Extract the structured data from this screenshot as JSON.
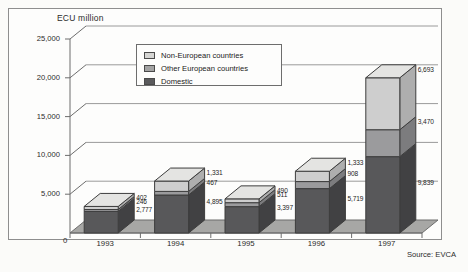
{
  "figure": {
    "source_note": "Source: EVCA"
  },
  "legend": {
    "items": [
      {
        "label": "Non-European countries",
        "key": "non_european",
        "color": "#d5d5d3"
      },
      {
        "label": "Other European countries",
        "key": "other_european",
        "color": "#a3a3a3"
      },
      {
        "label": "Domestic",
        "key": "domestic",
        "color": "#5a5a5c"
      }
    ]
  },
  "chart_data": {
    "type": "bar",
    "subtype": "stacked-column-3d",
    "title": "ECU million",
    "xlabel": "",
    "ylabel": "ECU million",
    "categories": [
      "1993",
      "1994",
      "1995",
      "1996",
      "1997"
    ],
    "ylim": [
      0,
      25000
    ],
    "ytick_labels": [
      "25,000",
      "20,000",
      "15,000",
      "10,000",
      "5,000"
    ],
    "ytick_values": [
      25000,
      20000,
      15000,
      10000,
      5000
    ],
    "origin_label": "0",
    "grid": true,
    "legend_position": "upper-left-inside",
    "series": [
      {
        "name": "Domestic",
        "color": "#58585a",
        "values": [
          2777,
          4895,
          3397,
          5719,
          9839
        ],
        "labels": [
          "2,777",
          "4,895",
          "3,397",
          "5,719",
          "9,839"
        ]
      },
      {
        "name": "Other European countries",
        "color": "#9b9b9d",
        "values": [
          246,
          467,
          511,
          908,
          3470
        ],
        "labels": [
          "246",
          "467",
          "511",
          "908",
          "3,470"
        ]
      },
      {
        "name": "Non-European countries",
        "color": "#cecece",
        "values": [
          402,
          1331,
          490,
          1333,
          6693
        ],
        "labels": [
          "402",
          "1,331",
          "490",
          "1,333",
          "6,693"
        ]
      }
    ],
    "totals": [
      3425,
      6693,
      4398,
      7960,
      20002
    ]
  }
}
